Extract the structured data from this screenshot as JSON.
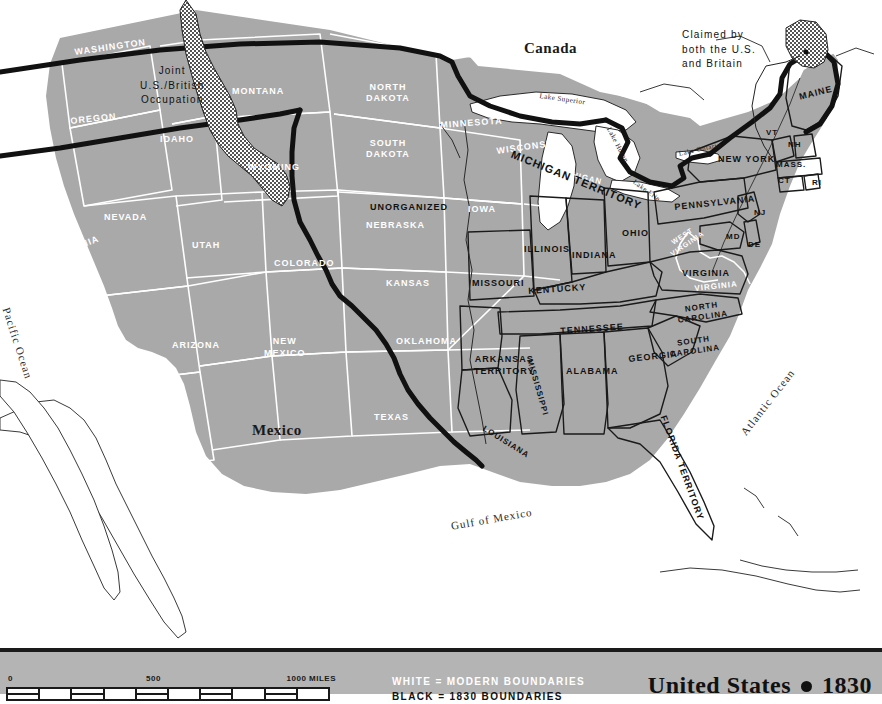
{
  "page_header": "US 1830  ●  3",
  "map": {
    "title_bar": {
      "title": "United States",
      "separator_icon": "bullet-dot",
      "year": "1830"
    },
    "scale": {
      "zero": "0",
      "mid": "500",
      "max": "1000 MILES",
      "segments": 10
    },
    "legend_keys": [
      {
        "text": "WHITE = MODERN BOUNDARIES",
        "color": "#ffffff"
      },
      {
        "text": "BLACK = 1830 BOUNDARIES",
        "color": "#111111"
      }
    ],
    "colors": {
      "land": "#a9a9a9",
      "water": "#ffffff",
      "modern_boundary": "#ffffff",
      "historic_boundary": "#111111",
      "legend_band": "#b4b4b4",
      "disputed_hatch": "#555555"
    },
    "annotations": [
      {
        "id": "joint-occupation",
        "text": "Joint\nU.S./British\nOccupation"
      },
      {
        "id": "claimed-by-both",
        "text": "Claimed by\nboth the U.S.\nand Britain"
      }
    ],
    "countries": [
      {
        "id": "canada",
        "label": "Canada"
      },
      {
        "id": "mexico",
        "label": "Mexico"
      }
    ],
    "oceans": [
      {
        "id": "pacific-ocean",
        "label": "Pacific Ocean"
      },
      {
        "id": "atlantic-ocean",
        "label": "Atlantic Ocean"
      },
      {
        "id": "gulf-of-mexico",
        "label": "Gulf of Mexico"
      }
    ],
    "lakes": [
      {
        "id": "lake-superior",
        "label": "Lake Superior"
      },
      {
        "id": "lake-huron",
        "label": "Lake Huron"
      },
      {
        "id": "lake-erie",
        "label": "Lake Erie"
      },
      {
        "id": "lake-ontario",
        "label": "Lake Ontario"
      }
    ],
    "modern_states": [
      {
        "id": "washington",
        "label": "WASHINGTON"
      },
      {
        "id": "oregon",
        "label": "OREGON"
      },
      {
        "id": "idaho",
        "label": "IDAHO"
      },
      {
        "id": "montana",
        "label": "MONTANA"
      },
      {
        "id": "wyoming",
        "label": "WYOMING"
      },
      {
        "id": "north-dakota",
        "label": "NORTH\nDAKOTA"
      },
      {
        "id": "south-dakota",
        "label": "SOUTH\nDAKOTA"
      },
      {
        "id": "minnesota",
        "label": "MINNESOTA"
      },
      {
        "id": "wisconsin",
        "label": "WISCONSIN"
      },
      {
        "id": "michigan",
        "label": "MICHIGAN"
      },
      {
        "id": "iowa",
        "label": "IOWA"
      },
      {
        "id": "nebraska",
        "label": "NEBRASKA"
      },
      {
        "id": "nevada",
        "label": "NEVADA"
      },
      {
        "id": "utah",
        "label": "UTAH"
      },
      {
        "id": "colorado",
        "label": "COLORADO"
      },
      {
        "id": "kansas",
        "label": "KANSAS"
      },
      {
        "id": "california",
        "label": "CALIFORNIA"
      },
      {
        "id": "arizona",
        "label": "ARIZONA"
      },
      {
        "id": "new-mexico",
        "label": "NEW\nMEXICO"
      },
      {
        "id": "oklahoma",
        "label": "OKLAHOMA"
      },
      {
        "id": "texas",
        "label": "TEXAS"
      },
      {
        "id": "west-virginia",
        "label": "WEST\nVIRGINIA"
      },
      {
        "id": "virginia-modern",
        "label": "VIRGINIA"
      }
    ],
    "historic_states": [
      {
        "id": "michigan-territory",
        "label": "MICHIGAN TERRITORY"
      },
      {
        "id": "unorganized",
        "label": "UNORGANIZED"
      },
      {
        "id": "missouri",
        "label": "MISSOURI"
      },
      {
        "id": "illinois",
        "label": "ILLINOIS"
      },
      {
        "id": "indiana",
        "label": "INDIANA"
      },
      {
        "id": "ohio",
        "label": "OHIO"
      },
      {
        "id": "kentucky",
        "label": "KENTUCKY"
      },
      {
        "id": "tennessee",
        "label": "TENNESSEE"
      },
      {
        "id": "arkansas-territory",
        "label": "ARKANSAS\nTERRITORY"
      },
      {
        "id": "louisiana",
        "label": "LOUISIANA"
      },
      {
        "id": "mississippi",
        "label": "MISSISSIPPI"
      },
      {
        "id": "alabama",
        "label": "ALABAMA"
      },
      {
        "id": "georgia",
        "label": "GEORGIA"
      },
      {
        "id": "florida-territory",
        "label": "FLORIDA TERRITORY"
      },
      {
        "id": "south-carolina",
        "label": "SOUTH\nCAROLINA"
      },
      {
        "id": "north-carolina",
        "label": "NORTH\nCAROLINA"
      },
      {
        "id": "virginia",
        "label": "VIRGINIA"
      },
      {
        "id": "maryland",
        "label": "MD"
      },
      {
        "id": "delaware",
        "label": "DE"
      },
      {
        "id": "new-jersey",
        "label": "NJ"
      },
      {
        "id": "pennsylvania",
        "label": "PENNSYLVANIA"
      },
      {
        "id": "new-york",
        "label": "NEW YORK"
      },
      {
        "id": "connecticut",
        "label": "CT"
      },
      {
        "id": "rhode-island",
        "label": "RI"
      },
      {
        "id": "massachusetts",
        "label": "MASS."
      },
      {
        "id": "vermont",
        "label": "VT"
      },
      {
        "id": "new-hampshire",
        "label": "NH"
      },
      {
        "id": "maine",
        "label": "MAINE"
      }
    ]
  }
}
